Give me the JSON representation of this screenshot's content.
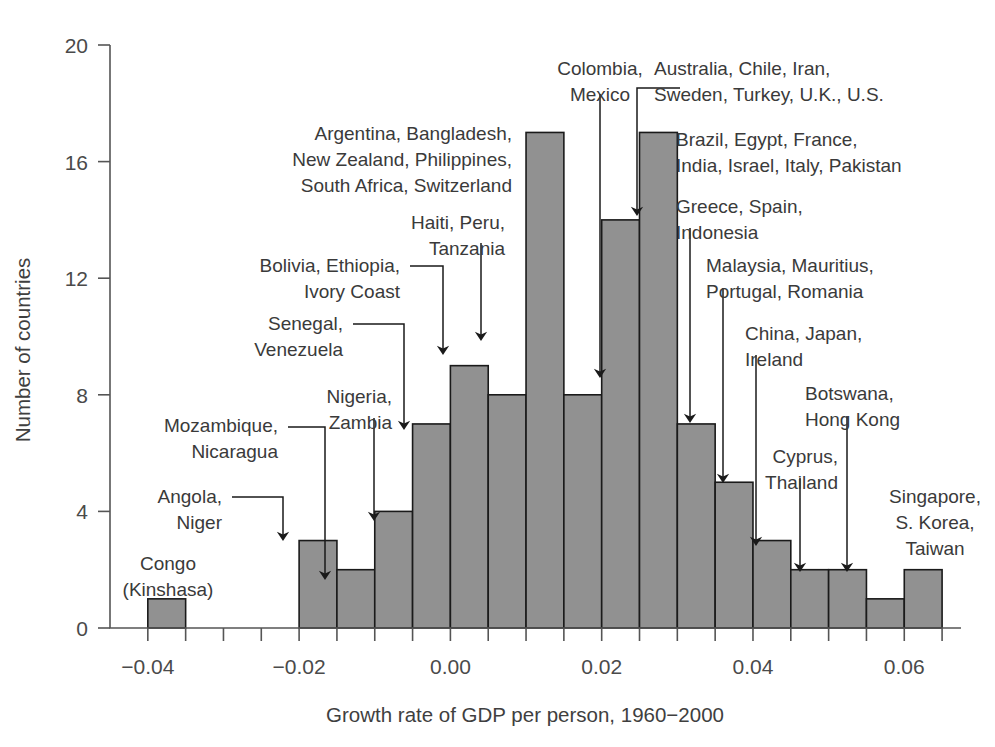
{
  "chart_data": {
    "type": "bar",
    "title": "",
    "subtitle": "",
    "xlabel": "Growth rate of GDP per person, 1960−2000",
    "ylabel": "Number of countries",
    "xlim": [
      -0.045,
      0.0675
    ],
    "ylim": [
      0,
      20
    ],
    "grid": false,
    "legend": null,
    "bin_width": 0.005,
    "x_ticks": [
      -0.04,
      -0.02,
      0.0,
      0.02,
      0.04,
      0.06
    ],
    "x_tick_labels": [
      "−0.04",
      "−0.02",
      "0.00",
      "0.02",
      "0.04",
      "0.06"
    ],
    "x_minor_tick_step": 0.005,
    "y_ticks": [
      0,
      4,
      8,
      12,
      16,
      20
    ],
    "y_tick_labels": [
      "0",
      "4",
      "8",
      "12",
      "16",
      "20"
    ],
    "bin_edges": [
      -0.04,
      -0.035,
      -0.03,
      -0.025,
      -0.02,
      -0.015,
      -0.01,
      -0.005,
      0.0,
      0.005,
      0.01,
      0.015,
      0.02,
      0.025,
      0.03,
      0.035,
      0.04,
      0.045,
      0.05,
      0.055,
      0.06,
      0.065
    ],
    "categories": [
      "-0.040 to -0.035",
      "-0.035 to -0.030",
      "-0.030 to -0.025",
      "-0.025 to -0.020",
      "-0.020 to -0.015",
      "-0.015 to -0.010",
      "-0.010 to -0.005",
      "-0.005 to 0.000",
      "0.000 to 0.005",
      "0.005 to 0.010",
      "0.010 to 0.015",
      "0.015 to 0.020",
      "0.020 to 0.025",
      "0.025 to 0.030",
      "0.030 to 0.035",
      "0.035 to 0.040",
      "0.040 to 0.045",
      "0.045 to 0.050",
      "0.050 to 0.055",
      "0.055 to 0.060",
      "0.060 to 0.065"
    ],
    "values": [
      1,
      0,
      0,
      0,
      3,
      2,
      4,
      7,
      9,
      8,
      17,
      8,
      14,
      17,
      7,
      5,
      3,
      2,
      2,
      1,
      2
    ],
    "bar_fill": "#919191",
    "bar_stroke": "#1a1a1a",
    "annotations": [
      {
        "id": "congo",
        "label": "Congo\n(Kinshasa)",
        "bin_index": 0,
        "value": 1,
        "has_arrow": false
      },
      {
        "id": "angola-niger",
        "label": "Angola,\nNiger",
        "bin_index": 4,
        "value": 3,
        "has_arrow": true
      },
      {
        "id": "mozambique-nicaragua",
        "label": "Mozambique,\nNicaragua",
        "bin_index": 5,
        "value": 2,
        "has_arrow": true
      },
      {
        "id": "nigeria-zambia",
        "label": "Nigeria,\nZambia",
        "bin_index": 6,
        "value": 4,
        "has_arrow": true
      },
      {
        "id": "senegal-venezuela",
        "label": "Senegal,\nVenezuela",
        "bin_index": 7,
        "value": 7,
        "has_arrow": true
      },
      {
        "id": "bolivia-ethiopia-ivorycoast",
        "label": "Bolivia, Ethiopia,\nIvory Coast",
        "bin_index": 8,
        "value": 9,
        "has_arrow": true
      },
      {
        "id": "haiti-peru-tanzania",
        "label": "Haiti, Peru,\nTanzania",
        "bin_index": 9,
        "value": 8,
        "has_arrow": true
      },
      {
        "id": "argentina-bangladesh",
        "label": "Argentina, Bangladesh,\nNew Zealand, Philippines,\nSouth Africa, Switzerland",
        "bin_index": 10,
        "value": 17,
        "has_arrow": false
      },
      {
        "id": "colombia-mexico",
        "label": "Colombia,\nMexico",
        "bin_index": 11,
        "value": 8,
        "has_arrow": false
      },
      {
        "id": "australia-chile-iran",
        "label": "Australia, Chile, Iran,\nSweden, Turkey, U.K., U.S.",
        "bin_index": 12,
        "value": 14,
        "has_arrow": true
      },
      {
        "id": "brazil-egypt-france",
        "label": "Brazil, Egypt, France,\nIndia, Israel, Italy, Pakistan",
        "bin_index": 13,
        "value": 17,
        "has_arrow": false
      },
      {
        "id": "greece-spain-indonesia",
        "label": "Greece, Spain,\nIndonesia",
        "bin_index": 14,
        "value": 7,
        "has_arrow": true
      },
      {
        "id": "malaysia-mauritius",
        "label": "Malaysia, Mauritius,\nPortugal, Romania",
        "bin_index": 15,
        "value": 5,
        "has_arrow": true
      },
      {
        "id": "china-japan-ireland",
        "label": "China, Japan,\nIreland",
        "bin_index": 16,
        "value": 3,
        "has_arrow": true
      },
      {
        "id": "cyprus-thailand",
        "label": "Cyprus,\nThailand",
        "bin_index": 17,
        "value": 2,
        "has_arrow": true
      },
      {
        "id": "botswana-hongkong",
        "label": "Botswana,\nHong Kong",
        "bin_index": 18,
        "value": 2,
        "has_arrow": true
      },
      {
        "id": "singapore-skorea-taiwan",
        "label": "Singapore,\nS. Korea,\nTaiwan",
        "bin_index": 20,
        "value": 2,
        "has_arrow": false
      }
    ]
  },
  "callouts": [
    {
      "name": "callout-congo",
      "lines": [
        "Congo",
        "(Kinshasa)"
      ],
      "x": 168,
      "y": 570,
      "anchor": "middle"
    },
    {
      "name": "callout-angola-niger",
      "lines": [
        "Angola,",
        "Niger"
      ],
      "x": 222,
      "y": 503,
      "anchor": "end"
    },
    {
      "name": "callout-mozambique-nicaragua",
      "lines": [
        "Mozambique,",
        "Nicaragua"
      ],
      "x": 278,
      "y": 432,
      "anchor": "end"
    },
    {
      "name": "callout-nigeria-zambia",
      "lines": [
        "Nigeria,",
        "Zambia"
      ],
      "x": 392,
      "y": 403,
      "anchor": "end"
    },
    {
      "name": "callout-senegal-venezuela",
      "lines": [
        "Senegal,",
        "Venezuela"
      ],
      "x": 343,
      "y": 330,
      "anchor": "end"
    },
    {
      "name": "callout-bolivia-ethiopia",
      "lines": [
        "Bolivia, Ethiopia,",
        "Ivory Coast"
      ],
      "x": 400,
      "y": 272,
      "anchor": "end"
    },
    {
      "name": "callout-haiti-peru-tanzania",
      "lines": [
        "Haiti, Peru,",
        "Tanzania"
      ],
      "x": 505,
      "y": 229,
      "anchor": "end"
    },
    {
      "name": "callout-argentina-bangladesh",
      "lines": [
        "Argentina, Bangladesh,",
        "New Zealand, Philippines,",
        "South Africa, Switzerland"
      ],
      "x": 512,
      "y": 140,
      "anchor": "end"
    },
    {
      "name": "callout-colombia-mexico",
      "lines": [
        "Colombia,",
        "Mexico"
      ],
      "x": 600,
      "y": 75,
      "anchor": "middle"
    },
    {
      "name": "callout-australia-chile-iran",
      "lines": [
        "Australia, Chile, Iran,",
        "Sweden, Turkey, U.K., U.S."
      ],
      "x": 654,
      "y": 75,
      "anchor": "start"
    },
    {
      "name": "callout-brazil-egypt-france",
      "lines": [
        "Brazil, Egypt, France,",
        "India, Israel, Italy, Pakistan"
      ],
      "x": 676,
      "y": 146,
      "anchor": "start"
    },
    {
      "name": "callout-greece-spain-indonesia",
      "lines": [
        "Greece, Spain,",
        "Indonesia"
      ],
      "x": 676,
      "y": 213,
      "anchor": "start"
    },
    {
      "name": "callout-malaysia-mauritius",
      "lines": [
        "Malaysia, Mauritius,",
        "Portugal, Romania"
      ],
      "x": 706,
      "y": 272,
      "anchor": "start"
    },
    {
      "name": "callout-china-japan-ireland",
      "lines": [
        "China, Japan,",
        "Ireland"
      ],
      "x": 745,
      "y": 340,
      "anchor": "start"
    },
    {
      "name": "callout-botswana-hongkong",
      "lines": [
        "Botswana,",
        "Hong Kong"
      ],
      "x": 805,
      "y": 400,
      "anchor": "start"
    },
    {
      "name": "callout-cyprus-thailand",
      "lines": [
        "Cyprus,",
        "Thailand"
      ],
      "x": 838,
      "y": 463,
      "anchor": "end"
    },
    {
      "name": "callout-singapore-skorea-taiwan",
      "lines": [
        "Singapore,",
        "S. Korea,",
        "Taiwan"
      ],
      "x": 935,
      "y": 503,
      "anchor": "middle"
    }
  ],
  "leaders": [
    {
      "name": "leader-angola-niger",
      "d": "M 232 497 L 283 497 L 283 536"
    },
    {
      "name": "leader-mozambique-nicaragua",
      "d": "M 288 427 L 325 427 L 325 575"
    },
    {
      "name": "leader-nigeria-zambia",
      "d": "M 374 418 L 374 516"
    },
    {
      "name": "leader-senegal-venezuela",
      "d": "M 353 324 L 404 324 L 404 425"
    },
    {
      "name": "leader-bolivia-ethiopia",
      "d": "M 410 266 L 443 266 L 443 350"
    },
    {
      "name": "leader-haiti-peru-tanzania",
      "d": "M 481 243 L 481 336"
    },
    {
      "name": "leader-colombia-mexico",
      "d": "M 600 94 L 600 373"
    },
    {
      "name": "leader-australia-chile-iran",
      "d": "M 680 88 L 637 88 L 637 211"
    },
    {
      "name": "leader-greece-spain-indonesia",
      "d": "M 690 228 L 690 418"
    },
    {
      "name": "leader-malaysia-mauritius",
      "d": "M 723 288 L 723 478"
    },
    {
      "name": "leader-china-japan-ireland",
      "d": "M 756 355 L 756 541"
    },
    {
      "name": "leader-cyprus-thailand",
      "d": "M 800 478 L 800 567"
    },
    {
      "name": "leader-botswana-hongkong",
      "d": "M 847 416 L 847 567"
    }
  ]
}
